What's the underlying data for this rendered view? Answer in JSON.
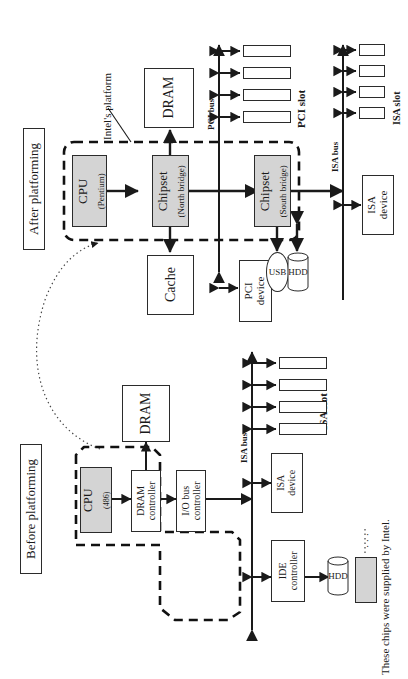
{
  "figure": {
    "orientation": "rotated-90-ccw",
    "sections": {
      "after": {
        "caption": "After platforming"
      },
      "before": {
        "caption": "Before platforming"
      }
    }
  },
  "after": {
    "annotation_platform": "Intel's platform",
    "blocks": {
      "cpu": {
        "line1": "CPU",
        "line2": "(Pentium)",
        "shaded": true
      },
      "north": {
        "line1": "Chipset",
        "line2": "(North bridge)",
        "shaded": true
      },
      "south": {
        "line1": "Chipset",
        "line2": "(South bridge)",
        "shaded": true
      },
      "dram": {
        "line1": "DRAM",
        "shaded": false
      },
      "cache": {
        "line1": "Cache",
        "shaded": false
      },
      "pci_device": {
        "line1": "PCI",
        "line2": "device",
        "shaded": false
      },
      "isa_device": {
        "line1": "ISA",
        "line2": "device",
        "shaded": false
      },
      "usb": {
        "line1": "USB"
      },
      "hdd": {
        "line1": "HDD"
      }
    },
    "buses": {
      "pci": "PCI bus",
      "isa": "ISA bus"
    },
    "slot_labels": {
      "pci": "PCI slot",
      "isa": "ISA slot"
    },
    "pci_slots": [
      "",
      "",
      "",
      ""
    ],
    "isa_slots": [
      "",
      "",
      "",
      ""
    ]
  },
  "before": {
    "blocks": {
      "cpu": {
        "line1": "CPU",
        "line2": "(486)",
        "shaded": true
      },
      "dram_controller": {
        "line1": "DRAM",
        "line2": "controller",
        "shaded": false
      },
      "io_bus_controller": {
        "line1": "I/O bus",
        "line2": "controller",
        "shaded": false
      },
      "dram": {
        "line1": "DRAM",
        "shaded": false
      },
      "isa_device": {
        "line1": "ISA",
        "line2": "device",
        "shaded": false
      },
      "ide_controller": {
        "line1": "IDE",
        "line2": "controller",
        "shaded": false
      },
      "hdd": {
        "line1": "HDD"
      }
    },
    "buses": {
      "isa": "ISA bus"
    },
    "slot_labels": {
      "isa": "ISA slot"
    },
    "isa_slots": [
      "",
      "",
      "",
      ""
    ]
  },
  "legend": {
    "note": "These chips were supplied by Intel.",
    "leader": "· · ·",
    "swatch_color": "#d4d4d4"
  }
}
